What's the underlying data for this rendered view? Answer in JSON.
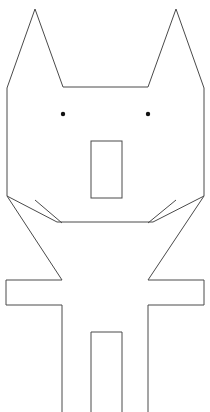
{
  "canvas": {
    "width": 210,
    "height": 412,
    "background_color": "#ffffff",
    "stroke_color": "#4a4a4a",
    "stroke_width": 1,
    "eye_fill_color": "#111111",
    "title": "Cat-like figure line drawing"
  },
  "drawing": {
    "type": "line-art",
    "subject": "standing cat-like creature with pointed ears",
    "shapes": [
      {
        "name": "body-outline",
        "kind": "polyline",
        "closed": false,
        "points": "7,88 35,9 63,87 148,87 176,9 204,88 204,196 153,222 57,222 7,196 7,88"
      },
      {
        "name": "left-arm-and-leg",
        "kind": "polyline",
        "closed": false,
        "points": "7,196 62,280 6,280 6,305 62,305 62,412"
      },
      {
        "name": "right-arm-and-leg",
        "kind": "polyline",
        "closed": false,
        "points": "204,196 148,280 204,280 204,305 148,305 148,412"
      },
      {
        "name": "jaw-left-line",
        "kind": "polyline",
        "closed": false,
        "points": "35,200 62,223"
      },
      {
        "name": "jaw-right-line",
        "kind": "polyline",
        "closed": false,
        "points": "176,200 148,223"
      },
      {
        "name": "center-leg-gap",
        "kind": "polyline",
        "closed": false,
        "points": "91,412 91,332 122,332 122,412"
      },
      {
        "name": "muzzle-rectangle",
        "kind": "rect",
        "x": 91,
        "y": 141,
        "width": 31,
        "height": 57
      }
    ],
    "eyes": [
      {
        "name": "left-eye",
        "cx": 63,
        "cy": 114,
        "r": 2.2
      },
      {
        "name": "right-eye",
        "cx": 148,
        "cy": 114,
        "r": 2.2
      }
    ]
  }
}
